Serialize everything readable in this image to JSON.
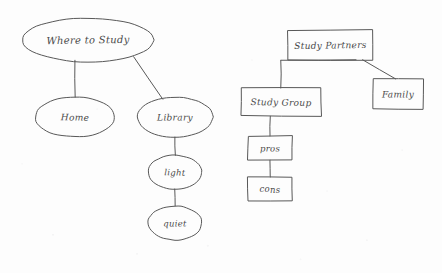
{
  "canvas": {
    "width": 442,
    "height": 273,
    "background_color": "#fdfdfd",
    "ink_color": "#585858",
    "text_color": "#4a4a4a",
    "medium": "hand-drawn pencil concept map on white paper"
  },
  "diagrams": [
    {
      "name": "where-to-study-map",
      "shape": "ellipse",
      "root": "Where to Study",
      "nodes": [
        {
          "id": "where-to-study",
          "label": "Where to Study",
          "cx": 88,
          "cy": 40,
          "rx": 66,
          "ry": 22,
          "size": "label-lg"
        },
        {
          "id": "home",
          "label": "Home",
          "cx": 75,
          "cy": 117,
          "rx": 40,
          "ry": 20,
          "size": "label-md"
        },
        {
          "id": "library",
          "label": "Library",
          "cx": 175,
          "cy": 117,
          "rx": 38,
          "ry": 20,
          "size": "label-md"
        },
        {
          "id": "light",
          "label": "light",
          "cx": 175,
          "cy": 172,
          "rx": 27,
          "ry": 17,
          "size": "label-sm"
        },
        {
          "id": "quiet",
          "label": "quiet",
          "cx": 175,
          "cy": 223,
          "rx": 27,
          "ry": 17,
          "size": "label-sm"
        }
      ],
      "edges": [
        {
          "from": "where-to-study",
          "to": "home",
          "x1": 75,
          "y1": 60,
          "x2": 75,
          "y2": 97
        },
        {
          "from": "where-to-study",
          "to": "library",
          "x1": 134,
          "y1": 57,
          "x2": 163,
          "y2": 99
        },
        {
          "from": "library",
          "to": "light",
          "x1": 175,
          "y1": 137,
          "x2": 175,
          "y2": 155
        },
        {
          "from": "light",
          "to": "quiet",
          "x1": 175,
          "y1": 189,
          "x2": 175,
          "y2": 206
        }
      ]
    },
    {
      "name": "study-partners-map",
      "shape": "rectangle",
      "root": "Study Partners",
      "nodes": [
        {
          "id": "study-partners",
          "label": "Study Partners",
          "x": 288,
          "y": 30,
          "w": 85,
          "h": 30,
          "size": "label-md"
        },
        {
          "id": "study-group",
          "label": "Study Group",
          "x": 241,
          "y": 88,
          "w": 80,
          "h": 28,
          "size": "label-md"
        },
        {
          "id": "family",
          "label": "Family",
          "x": 373,
          "y": 79,
          "w": 50,
          "h": 30,
          "size": "label-md"
        },
        {
          "id": "pros",
          "label": "pros",
          "x": 248,
          "y": 136,
          "w": 44,
          "h": 24,
          "size": "label-sm"
        },
        {
          "id": "cons",
          "label": "cons",
          "x": 248,
          "y": 177,
          "w": 44,
          "h": 24,
          "size": "label-sm"
        }
      ],
      "edges": [
        {
          "from": "study-partners",
          "to": "study-group",
          "x1": 281,
          "y1": 60,
          "x2": 281,
          "y2": 88
        },
        {
          "from": "study-partners",
          "to": "study-group",
          "x1": 281,
          "y1": 60,
          "x2": 356,
          "y2": 60
        },
        {
          "from": "study-partners",
          "to": "family",
          "x1": 363,
          "y1": 60,
          "x2": 396,
          "y2": 79
        },
        {
          "from": "study-group",
          "to": "pros",
          "x1": 270,
          "y1": 116,
          "x2": 270,
          "y2": 136
        },
        {
          "from": "pros",
          "to": "cons",
          "x1": 270,
          "y1": 160,
          "x2": 270,
          "y2": 177
        }
      ]
    }
  ]
}
